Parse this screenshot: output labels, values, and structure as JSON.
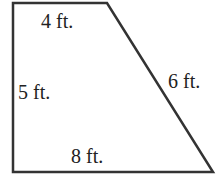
{
  "diagram": {
    "shape": "right trapezoid",
    "stroke_color": "#333333",
    "labels": {
      "top": "4 ft.",
      "left": "5 ft.",
      "slant": "6 ft.",
      "bottom": "8 ft."
    }
  }
}
